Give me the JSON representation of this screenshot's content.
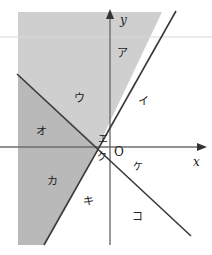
{
  "figure": {
    "title": "",
    "width": 212,
    "height": 255,
    "background": "#ffffff"
  },
  "axes": {
    "x_label": "x",
    "y_label": "y",
    "origin_label": "O",
    "x_axis_y": 147,
    "y_axis_x": 110,
    "stroke": "#6e6e6e",
    "arrow_color": "#333333"
  },
  "lines": [
    {
      "name": "steep-positive-line",
      "x1": 44,
      "y1": 245,
      "x2": 176,
      "y2": 11,
      "stroke": "#3a3a3a",
      "width": 1.6
    },
    {
      "name": "negative-slope-line",
      "x1": 17,
      "y1": 74,
      "x2": 191,
      "y2": 236,
      "stroke": "#3a3a3a",
      "width": 1.6
    }
  ],
  "shading": {
    "light_fill": "#cfcfcf",
    "dark_fill": "#b9b9b9",
    "light_region_points": "18,12 162,12 98,147 44,245 18,245",
    "dark_region_points": "18,74 98,147 44,245 18,245",
    "scan_line_y": 37,
    "scan_line_color": "#d8d8d8"
  },
  "region_labels": [
    {
      "key": "a",
      "text": "ア",
      "x": 117,
      "y": 48,
      "region": "upper-right-shaded-wedge"
    },
    {
      "key": "i",
      "text": "イ",
      "x": 138,
      "y": 96,
      "region": "right-white-wedge"
    },
    {
      "key": "u",
      "text": "ウ",
      "x": 74,
      "y": 93,
      "region": "upper-middle-shaded"
    },
    {
      "key": "e",
      "text": "エ",
      "x": 98,
      "y": 134,
      "region": "near-origin-upper"
    },
    {
      "key": "o",
      "text": "オ",
      "x": 36,
      "y": 126,
      "region": "left-dark-shaded"
    },
    {
      "key": "ka",
      "text": "カ",
      "x": 47,
      "y": 176,
      "region": "lower-left-dark-shaded"
    },
    {
      "key": "ki",
      "text": "キ",
      "x": 83,
      "y": 196,
      "region": "lower-middle-white"
    },
    {
      "key": "ku",
      "text": "ク",
      "x": 97,
      "y": 152,
      "region": "near-origin-lower"
    },
    {
      "key": "ke",
      "text": "ケ",
      "x": 133,
      "y": 162,
      "region": "lower-right-near-axis"
    },
    {
      "key": "ko",
      "text": "コ",
      "x": 132,
      "y": 211,
      "region": "bottom-right-white"
    }
  ]
}
